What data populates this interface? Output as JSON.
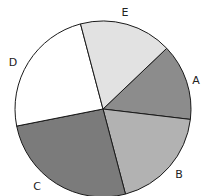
{
  "chart_data": {
    "type": "pie",
    "title": "",
    "start_angle_deg": -43.6,
    "direction": "clockwise",
    "categories": [
      "A",
      "B",
      "C",
      "D",
      "E"
    ],
    "values": [
      14,
      19,
      26,
      24,
      17
    ],
    "colors": [
      "#8c8c8c",
      "#b2b2b2",
      "#7b7b7b",
      "#ffffff",
      "#e2e2e2"
    ],
    "legend": "none",
    "labels_outside": true
  },
  "layout": {
    "cx": 103,
    "cy": 109,
    "r": 88,
    "label_positions": [
      {
        "x": 196,
        "y": 84
      },
      {
        "x": 179,
        "y": 178
      },
      {
        "x": 37,
        "y": 190
      },
      {
        "x": 13,
        "y": 66
      },
      {
        "x": 125,
        "y": 16
      }
    ]
  }
}
